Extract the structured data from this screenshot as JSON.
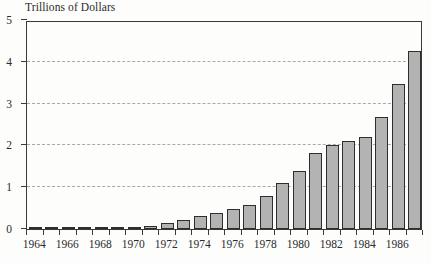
{
  "chart_data": {
    "type": "bar",
    "title": "Trillions of Dollars",
    "subtitle": "",
    "xlabel": "",
    "ylabel": "Trillions of Dollars",
    "ylim": [
      0,
      5
    ],
    "ytick_labels": [
      "0",
      "1",
      "2",
      "3",
      "4",
      "5"
    ],
    "ytick_values": [
      0,
      1,
      2,
      3,
      4,
      5
    ],
    "gridlines": [
      1,
      2,
      3,
      4
    ],
    "grid": true,
    "legend": null,
    "legend_position": "none",
    "xtick_labels": [
      "1964",
      "1966",
      "1968",
      "1970",
      "1972",
      "1974",
      "1976",
      "1978",
      "1980",
      "1982",
      "1984",
      "1986"
    ],
    "categories": [
      "1964",
      "1965",
      "1966",
      "1967",
      "1968",
      "1969",
      "1970",
      "1971",
      "1972",
      "1973",
      "1974",
      "1975",
      "1976",
      "1977",
      "1978",
      "1979",
      "1980",
      "1981",
      "1982",
      "1983",
      "1984",
      "1985",
      "1986",
      "1987"
    ],
    "values": [
      0.01,
      0.01,
      0.01,
      0.01,
      0.01,
      0.03,
      0.04,
      0.07,
      0.14,
      0.21,
      0.3,
      0.38,
      0.47,
      0.58,
      0.78,
      1.09,
      1.38,
      1.81,
      2.02,
      2.11,
      2.21,
      2.68,
      3.48,
      4.27
    ],
    "bar_fill_color": "#b3b3b3",
    "bar_edge_color": "#2e2e2e",
    "gridline_color": "#a9a9a9",
    "axis_color": "#3a3a3a",
    "background_color": "#fdfdfc"
  }
}
